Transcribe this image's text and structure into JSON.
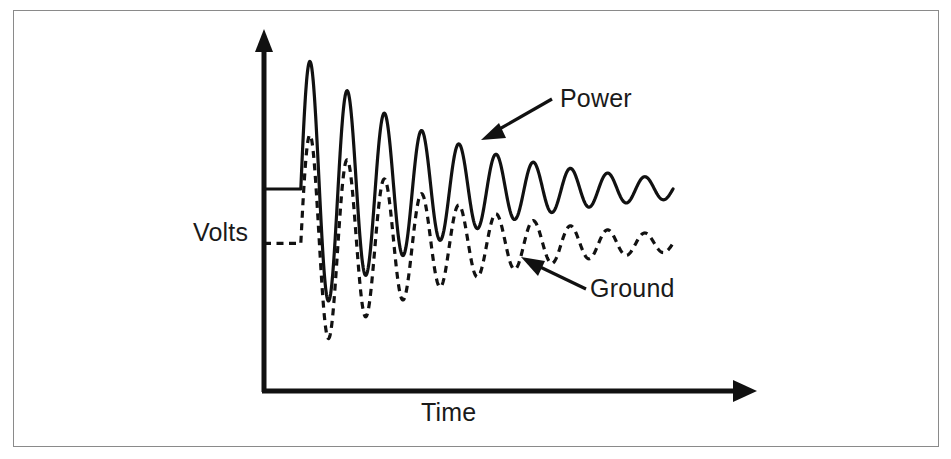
{
  "figure": {
    "background_color": "#ffffff",
    "border_color": "#8a8a8a",
    "ink_color": "#111111"
  },
  "axes": {
    "y_axis": {
      "name": "vertical-axis",
      "label": "Volts",
      "arrow": "up"
    },
    "x_axis": {
      "name": "horizontal-axis",
      "label": "Time",
      "arrow": "right"
    }
  },
  "annotations": [
    {
      "label": "Power",
      "points_to": "solid-trace",
      "arrow_direction": "down-left"
    },
    {
      "label": "Ground",
      "points_to": "dashed-trace",
      "arrow_direction": "up-left"
    }
  ],
  "chart_data": {
    "type": "line",
    "title": "",
    "xlabel": "Time",
    "ylabel": "Volts",
    "grid": false,
    "legend": "annotated-arrows",
    "axis_ranges": {
      "x": [
        0,
        1
      ],
      "y": [
        0,
        1
      ]
    },
    "series": [
      {
        "name": "Power",
        "style": "solid",
        "steady_state_before_step": 0.55,
        "steady_state_after_step": 0.55,
        "step_time": 0.09,
        "initial_amplitude": 0.4,
        "decay_constant": 2.6,
        "cycles": 10,
        "x": [
          0.0,
          0.09,
          0.13,
          0.19,
          0.24,
          0.3,
          0.35,
          0.41,
          0.46,
          0.52,
          0.57,
          0.63,
          0.68,
          0.74,
          0.79,
          0.85,
          0.9,
          0.96,
          1.0
        ],
        "y": [
          0.55,
          0.55,
          0.95,
          0.07,
          0.88,
          0.15,
          0.82,
          0.22,
          0.76,
          0.29,
          0.71,
          0.35,
          0.67,
          0.41,
          0.63,
          0.46,
          0.6,
          0.5,
          0.55
        ]
      },
      {
        "name": "Ground",
        "style": "dashed",
        "steady_state_before_step": 0.39,
        "steady_state_after_step": 0.39,
        "step_time": 0.09,
        "initial_amplitude": 0.34,
        "decay_constant": 2.6,
        "cycles": 10,
        "x": [
          0.0,
          0.09,
          0.14,
          0.2,
          0.25,
          0.31,
          0.36,
          0.42,
          0.47,
          0.53,
          0.58,
          0.64,
          0.69,
          0.75,
          0.8,
          0.86,
          0.91,
          0.97,
          1.0
        ],
        "y": [
          0.39,
          0.39,
          0.79,
          0.0,
          0.72,
          0.06,
          0.66,
          0.12,
          0.6,
          0.18,
          0.55,
          0.24,
          0.51,
          0.29,
          0.47,
          0.33,
          0.44,
          0.36,
          0.39
        ]
      }
    ]
  },
  "labels": {
    "volts": "Volts",
    "time": "Time",
    "power": "Power",
    "ground": "Ground"
  }
}
